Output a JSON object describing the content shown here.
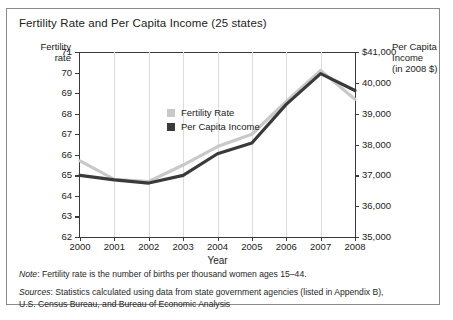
{
  "chart_data": {
    "type": "line",
    "title": "Fertility Rate and Per Capita Income (25 states)",
    "xlabel": "Year",
    "categories": [
      "2000",
      "2001",
      "2002",
      "2003",
      "2004",
      "2005",
      "2006",
      "2007",
      "2008"
    ],
    "x": [
      2000,
      2001,
      2002,
      2003,
      2004,
      2005,
      2006,
      2007,
      2008
    ],
    "grid": true,
    "legend_position": "top-left",
    "axes": {
      "left": {
        "label_line1": "Fertility",
        "label_line2": "rate",
        "ylim": [
          62,
          71
        ],
        "ticks": [
          "62",
          "63",
          "64",
          "65",
          "66",
          "67",
          "68",
          "69",
          "70",
          "71"
        ]
      },
      "right": {
        "label_line1": "Per Capita",
        "label_line2": "Income",
        "label_line3": "(in 2008 $)",
        "ylim": [
          35000,
          41000
        ],
        "ticks": [
          "35,000",
          "36,000",
          "37,000",
          "38,000",
          "39,000",
          "40,000",
          "$41,000"
        ]
      }
    },
    "series": [
      {
        "name": "Fertility Rate",
        "axis": "left",
        "color": "#c9c9c9",
        "values": [
          65.7,
          64.8,
          64.7,
          65.5,
          66.4,
          67.0,
          68.6,
          70.1,
          68.7
        ]
      },
      {
        "name": "Per Capita Income",
        "axis": "right",
        "color": "#3a3a3a",
        "values": [
          37000,
          36850,
          36750,
          37000,
          37700,
          38050,
          39300,
          40300,
          39750
        ]
      }
    ]
  },
  "notes": {
    "note_label": "Note",
    "note_text": ": Fertility rate is the number of births per thousand women ages 15–44.",
    "sources_label": "Sources",
    "sources_text_line1": ": Statistics calculated using data from state government agencies (listed in Appendix B),",
    "sources_text_line2": "U.S. Census Bureau, and Bureau of Economic Analysis"
  }
}
